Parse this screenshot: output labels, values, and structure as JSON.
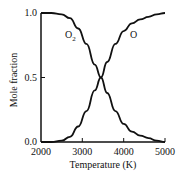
{
  "chart_data": {
    "type": "line",
    "title": "",
    "xlabel": "Temperature (K)",
    "ylabel": "Mole fraction",
    "xlim": [
      2000,
      5000
    ],
    "ylim": [
      0.0,
      1.0
    ],
    "x_ticks": [
      "2000",
      "3000",
      "4000",
      "5000"
    ],
    "y_ticks": [
      "0.0",
      "0.5",
      "1.0"
    ],
    "grid": false,
    "legend": "inline labels",
    "x": [
      2000,
      2250,
      2500,
      2700,
      2900,
      3100,
      3300,
      3450,
      3600,
      3800,
      4000,
      4200,
      4400,
      4600,
      4800,
      5000
    ],
    "series": [
      {
        "name": "O2",
        "label": "O₂",
        "values": [
          1.0,
          1.0,
          0.99,
          0.96,
          0.88,
          0.76,
          0.6,
          0.5,
          0.38,
          0.24,
          0.14,
          0.08,
          0.05,
          0.03,
          0.01,
          0.0
        ]
      },
      {
        "name": "O",
        "label": "O",
        "values": [
          0.0,
          0.0,
          0.01,
          0.04,
          0.12,
          0.24,
          0.4,
          0.5,
          0.62,
          0.76,
          0.86,
          0.92,
          0.95,
          0.97,
          0.99,
          1.0
        ]
      }
    ]
  }
}
